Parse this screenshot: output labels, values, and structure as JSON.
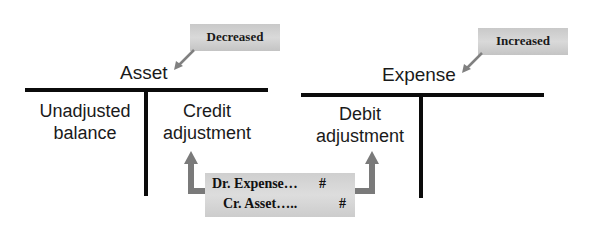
{
  "left_account": {
    "title": "Asset",
    "callout": "Decreased",
    "left_side_label_1": "Unadjusted",
    "left_side_label_2": "balance",
    "right_side_label_1": "Credit",
    "right_side_label_2": "adjustment"
  },
  "right_account": {
    "title": "Expense",
    "callout": "Increased",
    "left_side_label_1": "Debit",
    "left_side_label_2": "adjustment"
  },
  "journal_entry": {
    "debit_line": "Dr. Expense…",
    "debit_amount": "#",
    "credit_line": "Cr. Asset…..",
    "credit_amount": "#"
  },
  "colors": {
    "t_account_line": "#0b0b0b",
    "callout_bg": "#d0d0d0",
    "arrow": "#7a7a7a"
  }
}
